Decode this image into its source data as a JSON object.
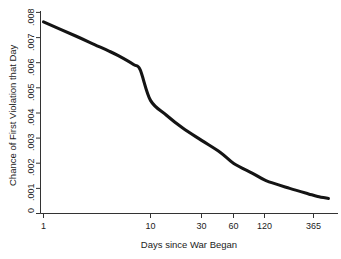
{
  "chart_data": {
    "type": "line",
    "title": "",
    "subtitle": "",
    "xlabel": "Days since War Began",
    "ylabel": "Chance of First Violation that Day",
    "xscale": "log",
    "yscale": "linear",
    "grid": false,
    "legend": null,
    "xlim": [
      1,
      500
    ],
    "ylim": [
      0,
      0.008
    ],
    "xticks": [
      1,
      10,
      30,
      60,
      120,
      365
    ],
    "xtick_labels": [
      "1",
      "10",
      "30",
      "60",
      "120",
      "365"
    ],
    "yticks": [
      0,
      0.001,
      0.002,
      0.003,
      0.004,
      0.005,
      0.006,
      0.007,
      0.008
    ],
    "ytick_labels": [
      "0",
      ".001",
      ".002",
      ".003",
      ".004",
      ".005",
      ".006",
      ".007",
      ".008"
    ],
    "series": [
      {
        "name": "Chance of First Violation that Day",
        "color": "#141414",
        "x": [
          1,
          2,
          3,
          4,
          5,
          7,
          8,
          10,
          14,
          20,
          30,
          45,
          60,
          90,
          120,
          200,
          300,
          365,
          460
        ],
        "values": [
          0.00762,
          0.00706,
          0.00672,
          0.00648,
          0.00628,
          0.00592,
          0.00572,
          0.0045,
          0.00392,
          0.0034,
          0.00291,
          0.00243,
          0.00199,
          0.0016,
          0.00131,
          0.001,
          0.00078,
          0.00068,
          0.0006
        ]
      }
    ],
    "annotations": []
  },
  "axes": {
    "x_title": "Days since War Began",
    "y_title": "Chance of First Violation that Day"
  }
}
